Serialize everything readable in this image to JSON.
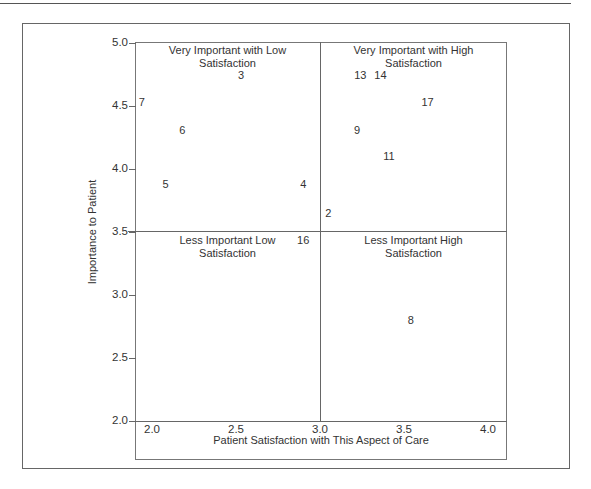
{
  "chart_data": {
    "type": "scatter",
    "title": "",
    "xlabel": "Patient Satisfaction with This Aspect of Care",
    "ylabel": "Importance to Patient",
    "xlim": [
      2.0,
      4.0
    ],
    "ylim": [
      2.0,
      5.0
    ],
    "x_ticks": [
      "2.0",
      "2.5",
      "3.0",
      "3.5",
      "4.0"
    ],
    "y_ticks": [
      "5.0",
      "4.5",
      "4.0",
      "3.5",
      "3.0",
      "2.5",
      "2.0"
    ],
    "grid": false,
    "quadrant_dividers": {
      "x": 3.0,
      "y": 3.5
    },
    "quadrants": [
      {
        "position": "top-left",
        "label": "Very Important with Low Satisfaction"
      },
      {
        "position": "top-right",
        "label": "Very Important with High Satisfaction"
      },
      {
        "position": "bottom-left",
        "label": "Less Important Low Satisfaction"
      },
      {
        "position": "bottom-right",
        "label": "Less Important High Satisfaction"
      }
    ],
    "points": [
      {
        "label": "2",
        "x": 3.05,
        "y": 3.65
      },
      {
        "label": "3",
        "x": 2.53,
        "y": 4.75
      },
      {
        "label": "4",
        "x": 2.9,
        "y": 3.88
      },
      {
        "label": "5",
        "x": 2.08,
        "y": 3.88
      },
      {
        "label": "6",
        "x": 2.18,
        "y": 4.31
      },
      {
        "label": "7",
        "x": 1.94,
        "y": 4.53
      },
      {
        "label": "8",
        "x": 3.54,
        "y": 2.8
      },
      {
        "label": "9",
        "x": 3.22,
        "y": 4.31
      },
      {
        "label": "11",
        "x": 3.41,
        "y": 4.1
      },
      {
        "label": "13",
        "x": 3.24,
        "y": 4.75
      },
      {
        "label": "14",
        "x": 3.36,
        "y": 4.75
      },
      {
        "label": "16",
        "x": 2.9,
        "y": 3.44
      },
      {
        "label": "17",
        "x": 3.64,
        "y": 4.53
      }
    ]
  },
  "quadrant_text": {
    "top_left_line1": "Very Important with Low",
    "top_left_line2": "Satisfaction",
    "top_right_line1": "Very Important with High",
    "top_right_line2": "Satisfaction",
    "bottom_left_line1": "Less Important Low",
    "bottom_left_line2": "Satisfaction",
    "bottom_right_line1": "Less Important High",
    "bottom_right_line2": "Satisfaction"
  }
}
